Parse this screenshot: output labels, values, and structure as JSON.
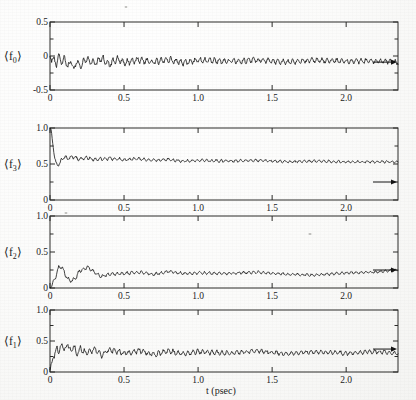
{
  "figure": {
    "background_color": "#fbfbfa",
    "ink_color": "#121212",
    "axis_color": "#2a2a28",
    "xlabel": "t  (psec)",
    "x_tick_labels": [
      "0",
      "0.5",
      "1.0",
      "1.5",
      "2.0"
    ],
    "x_ticks": [
      0,
      0.5,
      1.0,
      1.5,
      2.0
    ],
    "xlim": [
      0,
      2.35
    ],
    "panel_count": 4
  },
  "panels": [
    {
      "id": "panel-f0",
      "ylabel_base": "⟨ f",
      "ylabel_sub": "0",
      "ylabel_close": "⟩",
      "ylabel_plain": "⟨f₀⟩",
      "y_tick_labels": [
        "-0.5",
        "0",
        "0.5"
      ],
      "y_ticks": [
        -0.5,
        0,
        0.5
      ],
      "y_minor_ticks": [
        -0.25,
        0.25
      ],
      "ylim": [
        -0.5,
        0.5
      ],
      "arrow_value": -0.09
    },
    {
      "id": "panel-f3",
      "ylabel_base": "⟨ f",
      "ylabel_sub": "3",
      "ylabel_close": "⟩",
      "ylabel_plain": "⟨f₃⟩",
      "y_tick_labels": [
        "0",
        "0.5",
        "1.0"
      ],
      "y_ticks": [
        0,
        0.5,
        1.0
      ],
      "y_minor_ticks": [
        0.25,
        0.75
      ],
      "ylim": [
        0,
        1.0
      ],
      "arrow_value": 0.25
    },
    {
      "id": "panel-f2",
      "ylabel_base": "⟨ f",
      "ylabel_sub": "2",
      "ylabel_close": "⟩",
      "ylabel_plain": "⟨f₂⟩",
      "y_tick_labels": [
        "0",
        "0.5",
        "1.0"
      ],
      "y_ticks": [
        0,
        0.5,
        1.0
      ],
      "y_minor_ticks": [
        0.25,
        0.75
      ],
      "ylim": [
        0,
        1.0
      ],
      "arrow_value": 0.25
    },
    {
      "id": "panel-f1",
      "ylabel_base": "⟨ f",
      "ylabel_sub": "1",
      "ylabel_close": "⟩",
      "ylabel_plain": "⟨f₁⟩",
      "y_tick_labels": [
        "0",
        "0.5",
        "1.0"
      ],
      "y_ticks": [
        0,
        0.5,
        1.0
      ],
      "y_minor_ticks": [
        0.25,
        0.75
      ],
      "ylim": [
        0,
        1.0
      ],
      "arrow_value": 0.37
    }
  ],
  "chart_data": {
    "type": "line",
    "title": "",
    "xlabel": "t  (psec)",
    "ylabel": "",
    "xlim": [
      0,
      2.35
    ],
    "grid": false,
    "legend": "none",
    "series": [
      {
        "name": "⟨f₀⟩",
        "panel": "panel-f0",
        "ylim": [
          -0.5,
          0.5
        ],
        "asymptote": -0.09,
        "baseline": -0.055,
        "noise_amplitude": 0.075,
        "initial_value": 0.0,
        "x": [
          0.0,
          0.02,
          0.04,
          0.06,
          0.08,
          0.1,
          0.12,
          0.14,
          0.16,
          0.18,
          0.2,
          0.25,
          0.3,
          0.35,
          0.4,
          0.45,
          0.5,
          0.6,
          0.7,
          0.8,
          0.9,
          1.0,
          1.2,
          1.4,
          1.6,
          1.8,
          2.0,
          2.2,
          2.35
        ],
        "y": [
          0.0,
          -0.04,
          -0.12,
          -0.02,
          -0.1,
          -0.03,
          -0.19,
          -0.05,
          -0.22,
          -0.06,
          -0.14,
          -0.05,
          -0.11,
          -0.03,
          -0.13,
          -0.04,
          -0.1,
          -0.06,
          -0.09,
          -0.05,
          -0.1,
          -0.06,
          -0.08,
          -0.06,
          -0.09,
          -0.06,
          -0.08,
          -0.07,
          -0.09
        ]
      },
      {
        "name": "⟨f₃⟩",
        "panel": "panel-f3",
        "ylim": [
          0,
          1.0
        ],
        "asymptote": 0.25,
        "baseline": 0.54,
        "noise_amplitude": 0.035,
        "initial_value": 1.0,
        "x": [
          0.0,
          0.01,
          0.02,
          0.03,
          0.04,
          0.05,
          0.06,
          0.08,
          0.1,
          0.12,
          0.15,
          0.2,
          0.25,
          0.3,
          0.4,
          0.5,
          0.6,
          0.7,
          0.8,
          0.9,
          1.0,
          1.2,
          1.4,
          1.6,
          1.8,
          2.0,
          2.2,
          2.35
        ],
        "y": [
          1.0,
          0.93,
          0.78,
          0.62,
          0.5,
          0.47,
          0.5,
          0.56,
          0.6,
          0.57,
          0.6,
          0.57,
          0.59,
          0.56,
          0.58,
          0.56,
          0.57,
          0.55,
          0.56,
          0.54,
          0.55,
          0.54,
          0.55,
          0.53,
          0.54,
          0.53,
          0.53,
          0.53
        ]
      },
      {
        "name": "⟨f₂⟩",
        "panel": "panel-f2",
        "ylim": [
          0,
          1.0
        ],
        "asymptote": 0.25,
        "baseline": 0.2,
        "noise_amplitude": 0.035,
        "initial_value": 0.0,
        "x": [
          0.0,
          0.02,
          0.04,
          0.06,
          0.08,
          0.1,
          0.12,
          0.15,
          0.18,
          0.2,
          0.25,
          0.3,
          0.35,
          0.4,
          0.5,
          0.6,
          0.7,
          0.8,
          0.9,
          1.0,
          1.2,
          1.4,
          1.6,
          1.8,
          2.0,
          2.2,
          2.35
        ],
        "y": [
          0.0,
          0.06,
          0.16,
          0.29,
          0.3,
          0.2,
          0.12,
          0.1,
          0.16,
          0.24,
          0.29,
          0.22,
          0.16,
          0.19,
          0.2,
          0.22,
          0.19,
          0.23,
          0.2,
          0.21,
          0.2,
          0.22,
          0.19,
          0.18,
          0.21,
          0.22,
          0.25
        ]
      },
      {
        "name": "⟨f₁⟩",
        "panel": "panel-f1",
        "ylim": [
          0,
          1.0
        ],
        "asymptote": 0.37,
        "baseline": 0.3,
        "noise_amplitude": 0.07,
        "initial_value": 0.0,
        "x": [
          0.0,
          0.01,
          0.02,
          0.03,
          0.05,
          0.06,
          0.08,
          0.1,
          0.12,
          0.14,
          0.16,
          0.18,
          0.2,
          0.25,
          0.3,
          0.35,
          0.4,
          0.5,
          0.6,
          0.7,
          0.8,
          0.9,
          1.0,
          1.2,
          1.4,
          1.6,
          1.8,
          2.0,
          2.2,
          2.35
        ],
        "y": [
          0.0,
          0.12,
          0.28,
          0.22,
          0.44,
          0.3,
          0.47,
          0.33,
          0.48,
          0.3,
          0.46,
          0.26,
          0.38,
          0.3,
          0.38,
          0.27,
          0.36,
          0.3,
          0.35,
          0.28,
          0.34,
          0.29,
          0.33,
          0.3,
          0.34,
          0.29,
          0.33,
          0.3,
          0.33,
          0.3
        ]
      }
    ]
  }
}
